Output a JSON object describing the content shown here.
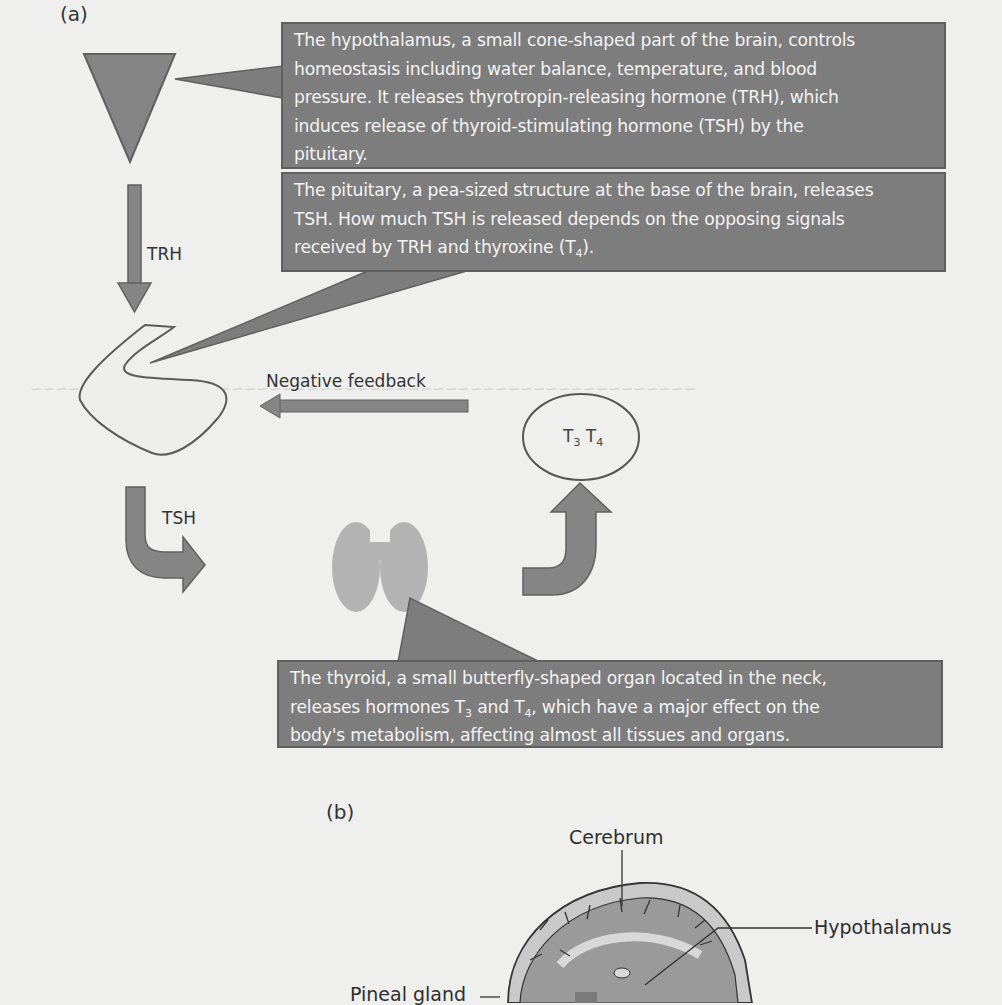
{
  "panels": {
    "a": {
      "label": "(a)"
    },
    "b": {
      "label": "(b)"
    }
  },
  "callouts": {
    "hypothalamus": {
      "lines": [
        "The hypothalamus, a small cone-shaped part of the brain, controls",
        "homeostasis including water balance, temperature, and blood",
        "pressure. It releases thyrotropin-releasing hormone (TRH), which",
        "induces release of thyroid-stimulating  hormone (TSH) by the",
        "pituitary."
      ]
    },
    "pituitary": {
      "line1": "The pituitary, a pea-sized structure at the base of the brain, releases",
      "line2": "TSH. How much TSH is released depends on the opposing signals",
      "line3_pre": "received by TRH and thyroxine (T",
      "line3_sub": "4",
      "line3_post": ")."
    },
    "thyroid": {
      "line1": "The thyroid, a  small butterfly-shaped organ located in the neck,",
      "line2_pre": "releases hormones T",
      "line2_sub1": "3",
      "line2_mid": " and T",
      "line2_sub2": "4",
      "line2_post": ", which have a major effect on the",
      "line3": "body's metabolism, affecting almost all tissues and organs."
    }
  },
  "flow_labels": {
    "trh": "TRH",
    "tsh": "TSH",
    "negative_feedback": "Negative feedback",
    "hormones": {
      "t": "T",
      "sub1": "3",
      "sub2": "4"
    }
  },
  "brain_labels": {
    "cerebrum": "Cerebrum",
    "hypothalamus": "Hypothalamus",
    "pineal_gland": "Pineal gland"
  },
  "colors": {
    "callout_fill": "#7d7d7d",
    "callout_border": "#5f5f5f",
    "arrow_fill": "#808080",
    "thyroid_fill": "#b3b3b3",
    "background": "#efefed"
  }
}
